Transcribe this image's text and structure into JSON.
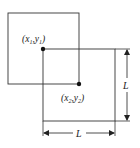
{
  "diagram": {
    "square1": {
      "x": 8,
      "y": 13,
      "size": 71
    },
    "square2": {
      "x": 43,
      "y": 49,
      "size": 72
    },
    "point1": {
      "label_main": "(x",
      "sub1": "1",
      "mid": ",y",
      "sub2": "1",
      "close": ")",
      "cx": 43,
      "cy": 49
    },
    "point2": {
      "label_main": "(x",
      "sub1": "2",
      "mid": ",y",
      "sub2": "2",
      "close": ")",
      "cx": 79,
      "cy": 84
    },
    "dimension_vertical": {
      "label": "L"
    },
    "dimension_horizontal": {
      "label": "L"
    },
    "colors": {
      "line": "#333333",
      "text": "#222222"
    }
  }
}
